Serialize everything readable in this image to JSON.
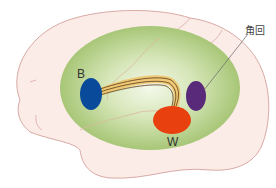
{
  "diagram": {
    "title": "",
    "labels": {
      "b": "B",
      "w": "W",
      "angular_gyrus": "角回"
    },
    "regions": [
      {
        "id": "B",
        "name": "B",
        "color": "#0a4a9a",
        "shape": "ellipse"
      },
      {
        "id": "W",
        "name": "W",
        "color": "#e8400e",
        "shape": "ellipse"
      },
      {
        "id": "angular-gyrus",
        "name": "角回",
        "color": "#5a2a7a",
        "shape": "ellipse"
      }
    ],
    "colors": {
      "brain_fill": "#fbece8",
      "brain_outline": "#d9a9a4",
      "ellipse_outer": "#9ec06a",
      "ellipse_inner": "#f4f8ea",
      "fiber_band": "#efc46a",
      "fiber_lines": "#5a3a1a",
      "leader_line": "#666666"
    }
  }
}
